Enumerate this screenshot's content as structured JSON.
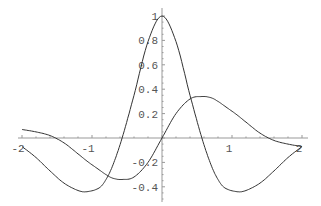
{
  "chart_data": {
    "type": "line",
    "title": "",
    "xlabel": "",
    "ylabel": "",
    "xlim": [
      -2,
      2
    ],
    "ylim": [
      -0.45,
      1.0
    ],
    "grid": false,
    "legend": null,
    "x_ticks": [
      "-2",
      "-1",
      "1",
      "2"
    ],
    "y_ticks": [
      "-0.4",
      "-0.2",
      "0.2",
      "0.4",
      "0.6",
      "0.8",
      "1"
    ],
    "x": [
      -2.0,
      -1.8,
      -1.6,
      -1.4,
      -1.2,
      -1.07,
      -0.9,
      -0.8,
      -0.7,
      -0.57,
      -0.4,
      -0.2,
      0.0,
      0.2,
      0.4,
      0.57,
      0.7,
      0.8,
      0.9,
      1.07,
      1.2,
      1.4,
      1.6,
      1.8,
      2.0
    ],
    "series": [
      {
        "name": "even curve",
        "values": [
          -0.07,
          -0.16,
          -0.27,
          -0.37,
          -0.43,
          -0.44,
          -0.41,
          -0.34,
          -0.22,
          0.0,
          0.35,
          0.79,
          1.0,
          0.79,
          0.35,
          0.0,
          -0.22,
          -0.34,
          -0.41,
          -0.44,
          -0.43,
          -0.37,
          -0.27,
          -0.16,
          -0.07
        ]
      },
      {
        "name": "odd curve",
        "values": [
          0.07,
          0.05,
          0.02,
          -0.04,
          -0.13,
          -0.19,
          -0.26,
          -0.3,
          -0.33,
          -0.34,
          -0.32,
          -0.2,
          0.0,
          0.2,
          0.32,
          0.34,
          0.33,
          0.3,
          0.26,
          0.19,
          0.13,
          0.04,
          -0.02,
          -0.05,
          -0.07
        ]
      }
    ]
  },
  "axes": {
    "x_tick_labels": [
      {
        "value": -2,
        "label": "-2"
      },
      {
        "value": -1,
        "label": "-1"
      },
      {
        "value": 1,
        "label": "1"
      },
      {
        "value": 2,
        "label": "2"
      }
    ],
    "y_tick_labels": [
      {
        "value": 1,
        "label": "1"
      },
      {
        "value": 0.8,
        "label": "0.8"
      },
      {
        "value": 0.6,
        "label": "0.6"
      },
      {
        "value": 0.4,
        "label": "0.4"
      },
      {
        "value": 0.2,
        "label": "0.2"
      },
      {
        "value": -0.2,
        "label": "-0.2"
      },
      {
        "value": -0.4,
        "label": "-0.4"
      }
    ],
    "colors": {
      "axis": "#999999",
      "curve": "#333333",
      "text": "#555555"
    }
  }
}
